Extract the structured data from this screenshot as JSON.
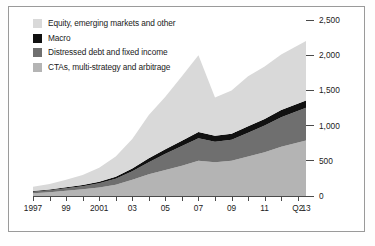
{
  "legend": {
    "items": [
      {
        "label": "Equity, emerging markets and other",
        "color": "#d9d9d9",
        "key": "equity"
      },
      {
        "label": "Macro",
        "color": "#111111",
        "key": "macro"
      },
      {
        "label": "Distressed debt and fixed income",
        "color": "#6f6f6f",
        "key": "distressed"
      },
      {
        "label": "CTAs, multi-strategy and arbitrage",
        "color": "#b4b4b4",
        "key": "ctas"
      }
    ]
  },
  "axes": {
    "y_ticks": [
      "0",
      "500",
      "1,000",
      "1,500",
      "2,000",
      "2,500"
    ],
    "y_values": [
      0,
      500,
      1000,
      1500,
      2000,
      2500
    ],
    "y_min": 0,
    "y_max": 2500,
    "x_labels": [
      "1997",
      "99",
      "2001",
      "03",
      "05",
      "07",
      "09",
      "11",
      "Q2",
      "13"
    ],
    "x_label_years": [
      1997,
      1999,
      2001,
      2003,
      2005,
      2007,
      2009,
      2011,
      2013,
      2013.5
    ],
    "x_min": 1997,
    "x_max": 2013.5
  },
  "chart_data": {
    "type": "area",
    "title": "",
    "xlabel": "",
    "ylabel": "",
    "ylim": [
      0,
      2500
    ],
    "grid": false,
    "legend_position": "top-left",
    "stacked": true,
    "stack_order_bottom_to_top": [
      "ctas",
      "distressed",
      "macro",
      "equity"
    ],
    "x": [
      1997,
      1998,
      1999,
      2000,
      2001,
      2002,
      2003,
      2004,
      2005,
      2006,
      2007,
      2008,
      2009,
      2010,
      2011,
      2012,
      2013.5
    ],
    "series": [
      {
        "name": "CTAs, multi-strategy and arbitrage",
        "color": "#b4b4b4",
        "values": [
          40,
          55,
          75,
          95,
          120,
          160,
          230,
          310,
          370,
          430,
          500,
          480,
          500,
          560,
          620,
          700,
          790
        ]
      },
      {
        "name": "Distressed debt and fixed income",
        "color": "#6f6f6f",
        "values": [
          20,
          25,
          35,
          45,
          60,
          85,
          120,
          170,
          230,
          280,
          320,
          290,
          300,
          340,
          380,
          420,
          465
        ]
      },
      {
        "name": "Macro",
        "color": "#111111",
        "values": [
          10,
          12,
          15,
          18,
          22,
          30,
          40,
          55,
          65,
          75,
          90,
          85,
          85,
          90,
          95,
          100,
          100
        ]
      },
      {
        "name": "Equity, emerging markets and other",
        "color": "#d9d9d9",
        "values": [
          60,
          78,
          105,
          142,
          198,
          285,
          420,
          615,
          745,
          915,
          1090,
          545,
          615,
          710,
          745,
          790,
          845
        ]
      }
    ],
    "totals": [
      130,
      170,
      230,
      300,
      400,
      560,
      810,
      1150,
      1410,
      1700,
      2000,
      1400,
      1500,
      1700,
      1840,
      2010,
      2200
    ]
  }
}
